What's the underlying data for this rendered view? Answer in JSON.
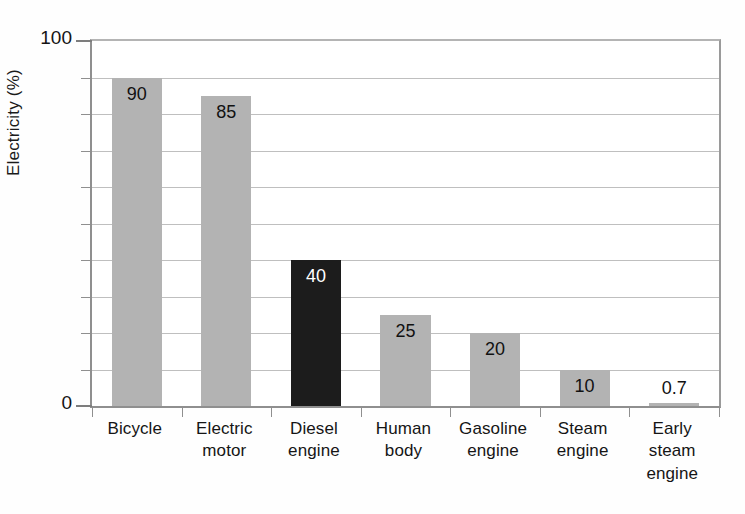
{
  "chart_data": {
    "type": "bar",
    "title": "",
    "subtitle": "",
    "xlabel": "",
    "ylabel": "Electricity (%)",
    "ylim": [
      0,
      100
    ],
    "ytick_values": [
      0,
      10,
      20,
      30,
      40,
      50,
      60,
      70,
      80,
      90,
      100
    ],
    "ytick_labels_shown": [
      "0",
      "100"
    ],
    "grid": true,
    "grid_axis": "y",
    "legend": null,
    "categories": [
      "Bicycle",
      "Electric motor",
      "Diesel engine",
      "Human body",
      "Gasoline engine",
      "Steam engine",
      "Early steam engine"
    ],
    "category_lines": [
      [
        "Bicycle"
      ],
      [
        "Electric",
        "motor"
      ],
      [
        "Diesel",
        "engine"
      ],
      [
        "Human",
        "body"
      ],
      [
        "Gasoline",
        "engine"
      ],
      [
        "Steam",
        "engine"
      ],
      [
        "Early",
        "steam",
        "engine"
      ]
    ],
    "values": [
      90,
      85,
      40,
      25,
      20,
      10,
      0.7
    ],
    "value_labels": [
      "90",
      "85",
      "40",
      "25",
      "20",
      "10",
      "0.7"
    ],
    "bar_colors": [
      "#b3b3b3",
      "#b3b3b3",
      "#1c1c1c",
      "#b3b3b3",
      "#b3b3b3",
      "#b3b3b3",
      "#b3b3b3"
    ],
    "highlight_category": "Diesel engine",
    "label_text_colors": [
      "#111111",
      "#111111",
      "#ffffff",
      "#111111",
      "#111111",
      "#111111",
      "#111111"
    ]
  },
  "axis": {
    "y_title": "Electricity (%)",
    "y_max_label": "100",
    "y_min_label": "0"
  },
  "colors": {
    "bar_gray": "#b3b3b3",
    "bar_dark": "#1c1c1c",
    "gridline": "#bfbfbf",
    "axis": "#8f8f8f",
    "text": "#111111",
    "background": "#ffffff"
  }
}
